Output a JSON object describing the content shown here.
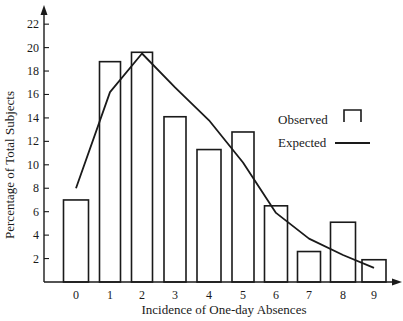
{
  "chart_data": {
    "type": "bar",
    "title": "",
    "xlabel": "Incidence of One-day Absences",
    "ylabel": "Percentage of Total Subjects",
    "categories": [
      "0",
      "1",
      "2",
      "3",
      "4",
      "5",
      "6",
      "7",
      "8",
      "9"
    ],
    "series": [
      {
        "name": "Observed",
        "kind": "bar",
        "values": [
          7.0,
          18.8,
          19.6,
          14.1,
          11.3,
          12.8,
          6.5,
          2.6,
          5.1,
          1.9
        ]
      },
      {
        "name": "Expected",
        "kind": "line",
        "values": [
          8.0,
          16.2,
          19.5,
          16.6,
          13.8,
          10.2,
          5.9,
          3.7,
          2.3,
          1.2
        ]
      }
    ],
    "yticks": [
      2,
      4,
      6,
      8,
      10,
      12,
      14,
      16,
      18,
      20,
      22
    ],
    "ylim": [
      0,
      23
    ],
    "grid": false,
    "legend_position": "right"
  },
  "legend": {
    "observed_label": "Observed",
    "expected_label": "Expected"
  },
  "axes": {
    "x_title": "Incidence of One-day Absences",
    "y_title": "Percentage of Total Subjects"
  },
  "colors": {
    "ink": "#1a1a1a",
    "background": "#ffffff"
  }
}
